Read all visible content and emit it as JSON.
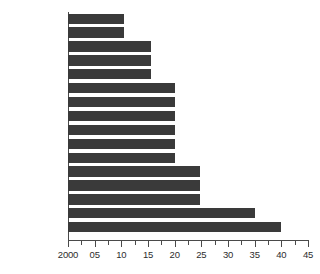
{
  "chart_data": {
    "type": "bar",
    "orientation": "horizontal",
    "title": "",
    "subtitle": "",
    "xlabel": "",
    "ylabel": "",
    "categories": [
      "Finland",
      "Switzerland",
      "United States",
      "Germany",
      "France",
      "Denmark",
      "Greece",
      "Italy",
      "Norway",
      "Portugal",
      "Sweden",
      "Belgium",
      "Netherlands",
      "Spain",
      "Ireland",
      "United Kingdom"
    ],
    "values": [
      10.5,
      10.5,
      15.5,
      15.5,
      15.5,
      20,
      20,
      20,
      20,
      20,
      20,
      24.8,
      24.8,
      24.8,
      35,
      40
    ],
    "xlim": [
      0,
      45
    ],
    "xtick_values": [
      0,
      5,
      10,
      15,
      20,
      25,
      30,
      35,
      40,
      45
    ],
    "xtick_labels": [
      "2000",
      "05",
      "10",
      "15",
      "20",
      "25",
      "30",
      "35",
      "40",
      "45"
    ],
    "xtick_minor_step": 2.5,
    "grid": false,
    "legend": "none",
    "bar_color": "#3a3a3a",
    "axis_color": "#4a4a4a",
    "text_color": "#2d2d2d",
    "background_color": "#ffffff"
  }
}
